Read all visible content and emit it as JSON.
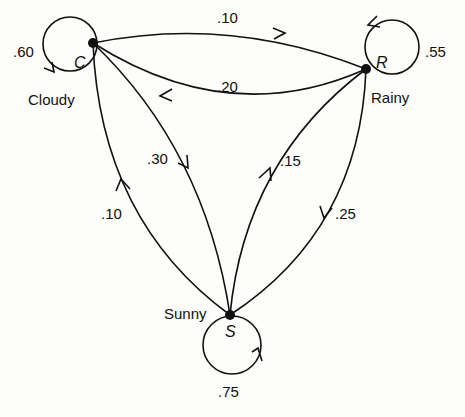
{
  "diagram": {
    "type": "markov-chain-state-diagram",
    "colors": {
      "stroke": "#111111",
      "background": "#fdfdfb"
    },
    "nodes": [
      {
        "id": "C",
        "letter": "C",
        "name": "Cloudy",
        "self_prob": ".60"
      },
      {
        "id": "R",
        "letter": "R",
        "name": "Rainy",
        "self_prob": ".55"
      },
      {
        "id": "S",
        "letter": "S",
        "name": "Sunny",
        "self_prob": ".75"
      }
    ],
    "edges": [
      {
        "from": "C",
        "to": "R",
        "prob": ".10"
      },
      {
        "from": "R",
        "to": "C",
        "prob": ".20"
      },
      {
        "from": "C",
        "to": "S",
        "prob": ".30"
      },
      {
        "from": "S",
        "to": "C",
        "prob": ".10"
      },
      {
        "from": "S",
        "to": "R",
        "prob": ".15"
      },
      {
        "from": "R",
        "to": "S",
        "prob": ".25"
      },
      {
        "from": "C",
        "to": "C",
        "prob": ".60"
      },
      {
        "from": "R",
        "to": "R",
        "prob": ".55"
      },
      {
        "from": "S",
        "to": "S",
        "prob": ".75"
      }
    ]
  }
}
